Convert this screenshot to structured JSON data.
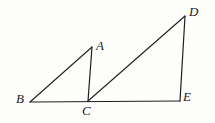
{
  "figure": {
    "background_color": "#fdfdfc",
    "stroke_color": "#1f1f1f",
    "stroke_width": 1.1,
    "canvas": {
      "width": 215,
      "height": 123
    },
    "points": {
      "A": {
        "x": 92,
        "y": 47,
        "label": "A",
        "label_x": 96,
        "label_y": 39
      },
      "B": {
        "x": 30,
        "y": 102,
        "label": "B",
        "label_x": 16,
        "label_y": 92
      },
      "C": {
        "x": 88,
        "y": 101,
        "label": "C",
        "label_x": 82,
        "label_y": 104
      },
      "D": {
        "x": 185,
        "y": 16,
        "label": "D",
        "label_x": 189,
        "label_y": 5
      },
      "E": {
        "x": 180,
        "y": 101,
        "label": "E",
        "label_x": 183,
        "label_y": 90
      }
    },
    "segments": [
      {
        "name": "segment-BA",
        "from": "B",
        "to": "A"
      },
      {
        "name": "segment-AC",
        "from": "A",
        "to": "C"
      },
      {
        "name": "segment-CD",
        "from": "C",
        "to": "D"
      },
      {
        "name": "segment-DE",
        "from": "D",
        "to": "E"
      },
      {
        "name": "segment-BE",
        "from": "B",
        "to": "E"
      }
    ],
    "triangles": [
      {
        "name": "triangle-ABC",
        "vertices": [
          "A",
          "B",
          "C"
        ]
      },
      {
        "name": "triangle-CDE",
        "vertices": [
          "C",
          "D",
          "E"
        ]
      }
    ]
  }
}
